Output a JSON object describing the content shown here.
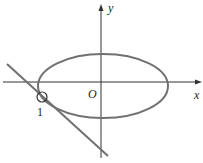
{
  "figure": {
    "axes": {
      "x_label": "x",
      "y_label": "y",
      "origin_label": "O"
    },
    "curves": [
      {
        "type": "ellipse",
        "color": "#707070"
      },
      {
        "type": "tangent-line",
        "color": "#707070"
      }
    ],
    "markers": [
      {
        "type": "circle",
        "label": "1"
      }
    ],
    "colors": {
      "axis": "#333333",
      "curve": "#707070"
    }
  }
}
